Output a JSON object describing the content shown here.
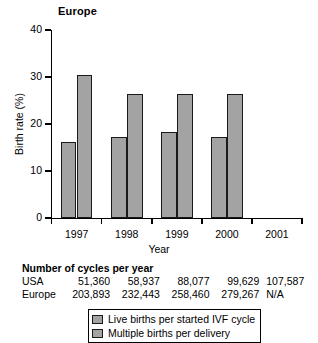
{
  "chart_data": {
    "type": "bar",
    "title": "Europe",
    "xlabel": "Year",
    "ylabel": "Birth rate (%)",
    "ylim": [
      0,
      40
    ],
    "yticks": [
      0,
      10,
      20,
      30,
      40
    ],
    "grid": false,
    "legend_position": "bottom",
    "categories": [
      "1997",
      "1998",
      "1999",
      "2000",
      "2001"
    ],
    "series": [
      {
        "name": "Live births per started IVF cycle",
        "values": [
          16.1,
          17.2,
          18.3,
          17.2,
          null
        ]
      },
      {
        "name": "Multiple births per delivery",
        "values": [
          30.5,
          26.3,
          26.3,
          26.3,
          null
        ]
      }
    ]
  },
  "table": {
    "caption": "Number of cycles per year",
    "rows": [
      {
        "label": "USA",
        "values": [
          "51,360",
          "58,937",
          "88,077",
          "99,629",
          "107,587"
        ]
      },
      {
        "label": "Europe",
        "values": [
          "203,893",
          "232,443",
          "258,460",
          "279,267",
          "N/A"
        ]
      }
    ]
  },
  "legend": {
    "items": [
      {
        "label": "Live births per started IVF cycle",
        "color": "#a3a3a3"
      },
      {
        "label": "Multiple births per delivery",
        "color": "#a3a3a3"
      }
    ]
  },
  "colors": {
    "bar_fill": "#a3a3a3",
    "bar_stroke": "#1a1a1a",
    "axis": "#000000",
    "background": "#ffffff"
  }
}
